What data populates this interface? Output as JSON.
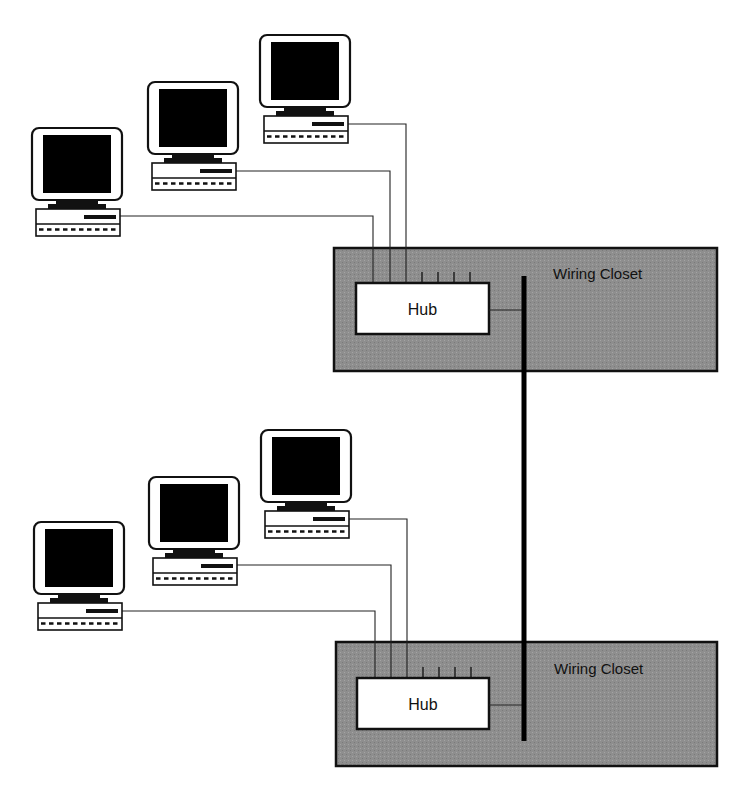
{
  "diagram": {
    "title": "",
    "colors": {
      "closet_fill": "#8e8e8e",
      "outline": "#111111",
      "hub_fill": "#ffffff",
      "screen": "#000000",
      "background": "#ffffff"
    },
    "labels": {
      "closet": "Wiring Closet",
      "hub": "Hub"
    },
    "backbone": {
      "x": 524,
      "y_top": 276,
      "y_bottom": 741,
      "width": 5
    },
    "groups": [
      {
        "id": "upper",
        "closet": {
          "x": 334,
          "y": 248,
          "w": 383,
          "h": 123,
          "label": "Wiring Closet",
          "label_x": 553,
          "label_y": 279
        },
        "hub": {
          "x": 356,
          "y": 283,
          "w": 133,
          "h": 51,
          "label": "Hub",
          "uplink_y": 310
        },
        "hub_ports": [
          422,
          438,
          454,
          470
        ],
        "computers": [
          {
            "x": 32,
            "y": 128,
            "cable_y": 216,
            "drop_x": 373
          },
          {
            "x": 148,
            "y": 82,
            "cable_y": 171,
            "drop_x": 390
          },
          {
            "x": 260,
            "y": 35,
            "cable_y": 124,
            "drop_x": 406
          }
        ]
      },
      {
        "id": "lower",
        "closet": {
          "x": 336,
          "y": 642,
          "w": 381,
          "h": 124,
          "label": "Wiring Closet",
          "label_x": 554,
          "label_y": 674
        },
        "hub": {
          "x": 357,
          "y": 678,
          "w": 132,
          "h": 51,
          "label": "Hub",
          "uplink_y": 705
        },
        "hub_ports": [
          423,
          439,
          455,
          471
        ],
        "computers": [
          {
            "x": 34,
            "y": 522,
            "cable_y": 611,
            "drop_x": 375
          },
          {
            "x": 149,
            "y": 477,
            "cable_y": 565,
            "drop_x": 391
          },
          {
            "x": 261,
            "y": 430,
            "cable_y": 519,
            "drop_x": 407
          }
        ]
      }
    ]
  }
}
